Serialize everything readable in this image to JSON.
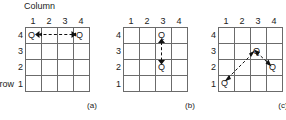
{
  "figure": {
    "title_label": "Column",
    "row_axis_label": "row",
    "column_headers": [
      "1",
      "2",
      "3",
      "4"
    ],
    "row_headers": [
      "4",
      "3",
      "2",
      "1"
    ],
    "queen_marker": "Q",
    "panels": [
      {
        "caption": "(a)",
        "queens": [
          {
            "row": 4,
            "col": 1
          },
          {
            "row": 4,
            "col": 4
          }
        ],
        "arrows": [
          {
            "kind": "horizontal",
            "from": {
              "row": 4,
              "col": 1
            },
            "to": {
              "row": 4,
              "col": 4
            },
            "style": "dashed",
            "heads": "both"
          }
        ],
        "show_column_title": true,
        "show_row_title": true
      },
      {
        "caption": "(b)",
        "queens": [
          {
            "row": 4,
            "col": 3
          },
          {
            "row": 2,
            "col": 3
          }
        ],
        "arrows": [
          {
            "kind": "vertical",
            "from": {
              "row": 4,
              "col": 3
            },
            "to": {
              "row": 2,
              "col": 3
            },
            "style": "dashed",
            "heads": "both"
          }
        ],
        "show_column_title": false,
        "show_row_title": false
      },
      {
        "caption": "(c)",
        "queens": [
          {
            "row": 1,
            "col": 1
          },
          {
            "row": 3,
            "col": 3
          },
          {
            "row": 2,
            "col": 4
          }
        ],
        "arrows": [
          {
            "kind": "diagonal",
            "from": {
              "row": 1,
              "col": 1
            },
            "to": {
              "row": 3,
              "col": 3
            },
            "style": "dashed",
            "heads": "both"
          },
          {
            "kind": "diagonal",
            "from": {
              "row": 3,
              "col": 3
            },
            "to": {
              "row": 2,
              "col": 4
            },
            "style": "dashed",
            "heads": "both"
          }
        ],
        "show_column_title": false,
        "show_row_title": false
      }
    ],
    "colors": {
      "grid_line": "#6b6b6b",
      "text": "#222222",
      "arrow": "#111111",
      "background": "#ffffff"
    }
  }
}
